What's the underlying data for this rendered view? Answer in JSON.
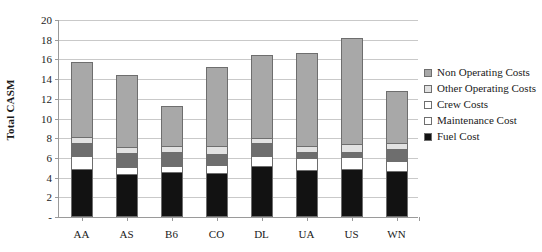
{
  "chart_data": {
    "type": "bar",
    "stacked": true,
    "title": "",
    "xlabel": "",
    "ylabel": "Total CASM",
    "ylim": [
      0,
      20
    ],
    "ytick_step": 2,
    "ytick_labels": [
      "-",
      "2",
      "4",
      "6",
      "8",
      "10",
      "12",
      "14",
      "16",
      "18",
      "20"
    ],
    "ytick_values": [
      0,
      2,
      4,
      6,
      8,
      10,
      12,
      14,
      16,
      18,
      20
    ],
    "grid": true,
    "legend_position": "right",
    "categories": [
      "AA",
      "AS",
      "B6",
      "CO",
      "DL",
      "UA",
      "US",
      "WN"
    ],
    "series": [
      {
        "name": "Fuel Cost",
        "color": "#121212",
        "values": [
          4.7,
          4.2,
          4.5,
          4.3,
          5.0,
          4.6,
          4.7,
          4.5
        ]
      },
      {
        "name": "Maintenance Cost",
        "color": "#ffffff",
        "values": [
          1.4,
          0.7,
          0.6,
          0.8,
          1.1,
          1.3,
          1.3,
          1.1
        ]
      },
      {
        "name": "Crew Costs",
        "color": "#6e6e6e",
        "values": [
          1.3,
          1.5,
          1.4,
          1.2,
          1.3,
          0.6,
          0.5,
          1.2
        ]
      },
      {
        "name": "Other Operating Costs",
        "color": "#e2e2e2",
        "values": [
          0.6,
          0.6,
          0.6,
          0.8,
          0.5,
          0.6,
          0.8,
          0.6
        ]
      },
      {
        "name": "Non Operating Costs",
        "color": "#a8a8a8",
        "values": [
          7.7,
          7.4,
          4.2,
          8.1,
          8.5,
          9.6,
          10.9,
          5.4
        ]
      }
    ],
    "totals": [
      15.7,
      14.4,
      11.3,
      15.2,
      16.4,
      16.7,
      18.2,
      12.8
    ]
  },
  "legend": {
    "items": [
      {
        "label": "Non Operating Costs",
        "color": "#a8a8a8"
      },
      {
        "label": "Other Operating Costs",
        "color": "#e2e2e2"
      },
      {
        "label": "Crew Costs",
        "color": "#ffffff"
      },
      {
        "label": "Maintenance Cost",
        "color": "#ffffff"
      },
      {
        "label": "Fuel Cost",
        "color": "#121212"
      }
    ]
  },
  "colors": {
    "gridline": "#c9c9c9",
    "axis": "#9a9a9a",
    "bar_outline": "#6e6e6e",
    "text": "#1a1a1a"
  }
}
